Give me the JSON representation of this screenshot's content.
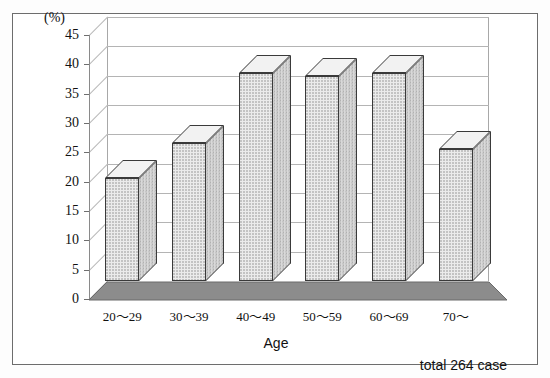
{
  "chart_data": {
    "type": "bar",
    "title": "",
    "subtitle": "",
    "categories": [
      "20〜29",
      "30〜39",
      "40〜49",
      "50〜59",
      "60〜69",
      "70〜"
    ],
    "values": [
      17.5,
      23.5,
      35.5,
      35.0,
      35.5,
      22.5
    ],
    "xlabel": "Age",
    "ylabel": "(%)",
    "ylim": [
      0,
      45
    ],
    "ytick_step": 5,
    "yticks": [
      "0",
      "5",
      "10",
      "15",
      "20",
      "25",
      "30",
      "35",
      "40",
      "45"
    ],
    "grid": true,
    "legend": false,
    "legend_position": "none",
    "annotation": "total 264 case",
    "style": "3d-column",
    "colors": {
      "bar_front": "#ebebeb",
      "bar_side": "#d9d9d9",
      "bar_top": "#f2f2f2",
      "bar_outline": "#3a3a3a",
      "floor": "#8c8c8c",
      "gridline": "#b4b4b4",
      "axis": "#8a8a8a",
      "frame": "#6d6d6d",
      "background": "#ffffff",
      "text": "#111111"
    }
  }
}
